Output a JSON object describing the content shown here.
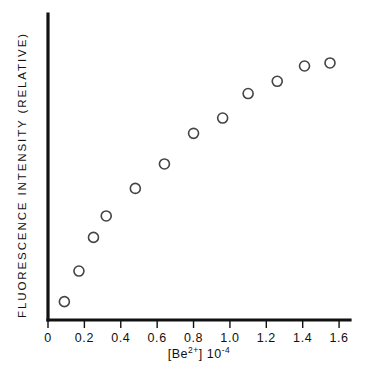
{
  "figure": {
    "background_color": "#ffffff",
    "axis_color": "#111111",
    "marker_color": "#444444",
    "marker_style": "open-circle"
  },
  "chart_data": {
    "type": "scatter",
    "title": "",
    "xlabel": "[Be2+] 10-4",
    "xlabel_parts": {
      "bracket_open": "[",
      "element": "Be",
      "charge_superscript": "2+",
      "bracket_close": "]",
      "factor_base": "10",
      "factor_exponent": "-4"
    },
    "ylabel": "FLUORESCENCE INTENSITY (RELATIVE)",
    "xlim": [
      0,
      1.66
    ],
    "ylim": [
      0,
      100
    ],
    "xticks": [
      0,
      0.2,
      0.4,
      0.6,
      0.8,
      1.0,
      1.2,
      1.4,
      1.6
    ],
    "xticklabels": [
      "0",
      "0.2",
      "0.4",
      "0.6",
      "0.8",
      "1.0",
      "1.2",
      "1.4",
      "1.6"
    ],
    "yticks": [],
    "yticklabels": [],
    "grid": false,
    "legend": null,
    "x": [
      0.09,
      0.17,
      0.25,
      0.32,
      0.48,
      0.64,
      0.8,
      0.96,
      1.1,
      1.26,
      1.41,
      1.55
    ],
    "y": [
      6,
      16,
      27,
      34,
      43,
      51,
      61,
      66,
      74,
      78,
      83,
      84
    ],
    "points": [
      {
        "x": 0.09,
        "y": 6
      },
      {
        "x": 0.17,
        "y": 16
      },
      {
        "x": 0.25,
        "y": 27
      },
      {
        "x": 0.32,
        "y": 34
      },
      {
        "x": 0.48,
        "y": 43
      },
      {
        "x": 0.64,
        "y": 51
      },
      {
        "x": 0.8,
        "y": 61
      },
      {
        "x": 0.96,
        "y": 66
      },
      {
        "x": 1.1,
        "y": 74
      },
      {
        "x": 1.26,
        "y": 78
      },
      {
        "x": 1.41,
        "y": 83
      },
      {
        "x": 1.55,
        "y": 84
      }
    ]
  }
}
